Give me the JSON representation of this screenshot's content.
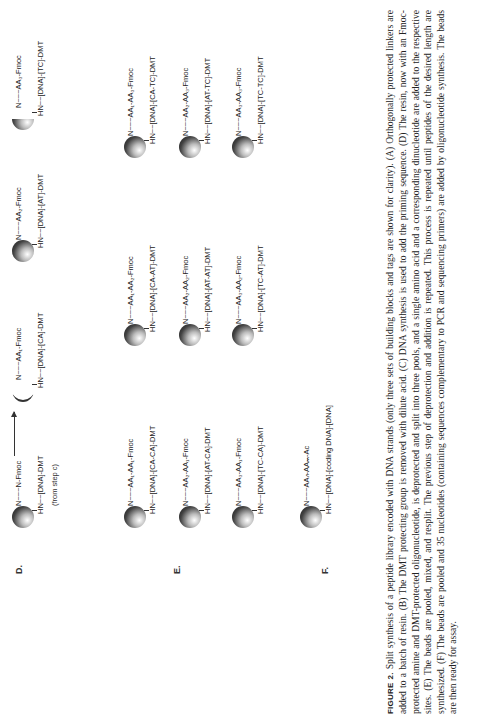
{
  "panels": {
    "D": {
      "label": "D.",
      "source_note": "(from step c)",
      "start": {
        "top": "N~~~N-Fmoc",
        "h": "H   H",
        "bottom": "HN~~[DNA]-DMT"
      },
      "products": [
        {
          "top": "N~~~AA₁-Fmoc",
          "h": "H",
          "bottom": "HN~~[DNA]-[CA]-DMT",
          "bead": "sliver"
        },
        {
          "top": "N~~~AA₂-Fmoc",
          "h": "H",
          "bottom": "HN~~[DNA]-[AT]-DMT",
          "bead": "full"
        },
        {
          "top": "N~~~AA₃-Fmoc",
          "h": "H",
          "bottom": "HN~~[DNA]-[TC]-DMT",
          "bead": "half"
        }
      ]
    },
    "E": {
      "label": "E.",
      "rows": [
        [
          {
            "top": "N~~~AA₁-AA₁-Fmoc",
            "h": "H",
            "bottom": "HN~~[DNA]-[CA-CA]-DMT"
          },
          {
            "top": "N~~~AA₁-AA₂-Fmoc",
            "h": "H",
            "bottom": "HN~~[DNA]-[CA-AT]-DMT"
          },
          {
            "top": "N~~~AA₁-AA₃-Fmoc",
            "h": "H",
            "bottom": "HN~~[DNA]-[CA-TC]-DMT"
          }
        ],
        [
          {
            "top": "N~~~AA₂-AA₁-Fmoc",
            "h": "H",
            "bottom": "HN~~[DNA]-[AT-CA]-DMT"
          },
          {
            "top": "N~~~AA₂-AA₂-Fmoc",
            "h": "H",
            "bottom": "HN~~[DNA]-[AT-AT]-DMT"
          },
          {
            "top": "N~~~AA₂-AA₃-Fmoc",
            "h": "H",
            "bottom": "HN~~[DNA]-[AT-TC]-DMT"
          }
        ],
        [
          {
            "top": "N~~~AA₃-AA₁-Fmoc",
            "h": "H",
            "bottom": "HN~~[DNA]-[TC-CA]-DMT"
          },
          {
            "top": "N~~~AA₃-AA₂-Fmoc",
            "h": "H",
            "bottom": "HN~~[DNA]-[TC-AT]-DMT"
          },
          {
            "top": "N~~~AA₃-AA₃-Fmoc",
            "h": "H",
            "bottom": "HN~~[DNA]-[TC-TC]-DMT"
          }
        ]
      ]
    },
    "F": {
      "label": "F.",
      "product": {
        "top": "N~~~AAₙ-AAₘ-Ac",
        "h": "H",
        "bottom": "HN~~[DNA]-[coding DNA]-[DNA]"
      }
    }
  },
  "caption": {
    "figure_label": "FIGURE 2.",
    "text": "Split synthesis of a peptide library encoded with DNA strands (only three sets of building blocks and tags are shown for clarity). (A) Orthogonally protected linkers are added to a batch of resin. (B) The DMT protecting group is removed with dilute acid. (C) DNA synthesis is used to add the priming sequence. (D) The resin, now with an Fmoc-protected amine and DMT-protected oligonucleotide, is deprotected and split into three pools, and a single amino acid and a corresponding dinucleotide are added to the respective sites. (E) The beads are pooled, mixed, and resplit. The previous step of deprotection and addition is repeated. This process is repeated until peptides of the desired length are synthesized. (F) The beads are pooled and 35 nucleotides (containing sequences complementary to PCR and sequencing primers) are added by oligonucleotide synthesis. The beads are then ready for assay."
  }
}
